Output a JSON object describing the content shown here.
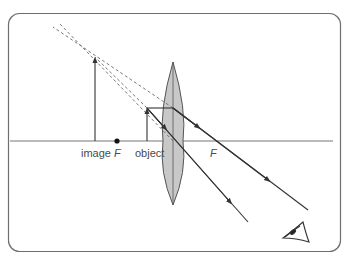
{
  "diagram": {
    "labels": {
      "image": "image",
      "focal_left": "F",
      "object": "object",
      "focal_right": "F"
    },
    "colors": {
      "frame": "#6e6e6e",
      "lines": "#333333",
      "lens_fill": "#c8c8c8",
      "lens_stroke": "#555555",
      "dashed": "#777777",
      "text": "#4a4a4a"
    },
    "elements": [
      {
        "id": "principal-axis",
        "type": "line"
      },
      {
        "id": "lens",
        "type": "convex-lens"
      },
      {
        "id": "object-arrow",
        "type": "arrow",
        "label": "object"
      },
      {
        "id": "image-arrow",
        "type": "arrow",
        "label": "image"
      },
      {
        "id": "focal-point-left",
        "type": "dot",
        "label": "F"
      },
      {
        "id": "focal-point-right",
        "type": "label",
        "label": "F"
      },
      {
        "id": "ray-parallel",
        "type": "ray"
      },
      {
        "id": "ray-center",
        "type": "ray"
      },
      {
        "id": "virtual-ray-extensions",
        "type": "dashed-lines"
      },
      {
        "id": "eye",
        "type": "icon"
      }
    ]
  }
}
